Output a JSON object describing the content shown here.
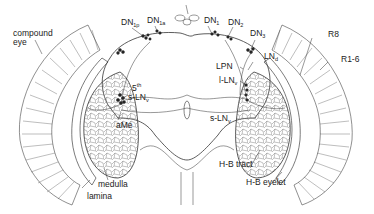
{
  "diagram": {
    "colors": {
      "line": "#3a3a3a",
      "neuropil": "#555555",
      "background": "#ffffff",
      "text": "#222222"
    },
    "labels": {
      "compound_eye": {
        "line1": "compound",
        "line2": "eye"
      },
      "dn1p": {
        "base": "DN",
        "sub": "1p"
      },
      "dn1a": {
        "base": "DN",
        "sub": "1a"
      },
      "dn1": {
        "base": "DN",
        "sub": "1"
      },
      "dn2": {
        "base": "DN",
        "sub": "2"
      },
      "dn3": {
        "base": "DN",
        "sub": "3"
      },
      "lnd": {
        "base": "LN",
        "sub": "d"
      },
      "lpn": {
        "base": "LPN"
      },
      "l_lnv": {
        "base": "l-LN",
        "sub": "v"
      },
      "s_lnv_right": {
        "base": "s-LN",
        "sub": "v"
      },
      "fifth_s_lnv": {
        "top": "5",
        "top_sup": "th",
        "base": "s-LN",
        "sub": "v"
      },
      "ame": {
        "base": "aMe"
      },
      "medulla": {
        "base": "medulla"
      },
      "lamina": {
        "base": "lamina"
      },
      "hb_tract": {
        "base": "H-B tract"
      },
      "hb_eyelet": {
        "base": "H-B eyelet"
      },
      "r8": {
        "base": "R8"
      },
      "r1_6": {
        "base": "R1-6"
      }
    }
  }
}
